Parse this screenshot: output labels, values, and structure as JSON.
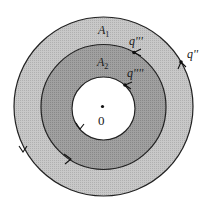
{
  "diagram": {
    "center_label": "0",
    "regions": [
      {
        "id": "A1",
        "label": "A",
        "subscript": "1",
        "fill": "#c4c4c4"
      },
      {
        "id": "A2",
        "label": "A",
        "subscript": "2",
        "fill": "#9a9a9a"
      }
    ],
    "points": [
      {
        "id": "q2",
        "label": "q''"
      },
      {
        "id": "q3",
        "label": "q'''"
      },
      {
        "id": "q4",
        "label": "q''''"
      }
    ],
    "colors": {
      "outer_ring": "#c4c4c4",
      "inner_ring": "#9a9a9a",
      "hole": "#ffffff",
      "stroke": "#222222"
    }
  }
}
